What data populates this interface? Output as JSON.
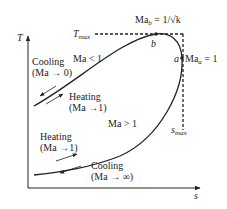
{
  "diagram": {
    "type": "T-s diagram (Rayleigh line)",
    "axes": {
      "y_label": "T",
      "x_label": "s"
    },
    "reference_lines": {
      "t_max": {
        "label": "T",
        "subscript": "max"
      },
      "s_max": {
        "label": "s",
        "subscript": "max"
      }
    },
    "points": {
      "a": {
        "label": "a",
        "annotation_base": "Ma",
        "annotation_sub": "a",
        "annotation_rest": " = 1"
      },
      "b": {
        "label": "b",
        "annotation_base": "Ma",
        "annotation_sub": "b",
        "annotation_rest": " = 1/√k"
      }
    },
    "regions": {
      "subsonic": "Ma < 1",
      "supersonic": "Ma > 1"
    },
    "processes": {
      "upper_cooling": {
        "line1": "Cooling",
        "line2": "(Ma → 0)"
      },
      "upper_heating": {
        "line1": "Heating",
        "line2": "(Ma →1)"
      },
      "lower_heating": {
        "line1": "Heating",
        "line2": "(Ma →1)"
      },
      "lower_cooling": {
        "line1": "Cooling",
        "line2": "(Ma → ∞)"
      }
    },
    "colors": {
      "line": "#222222",
      "background": "#ffffff"
    }
  }
}
